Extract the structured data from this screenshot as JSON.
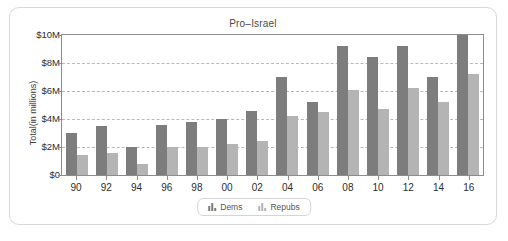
{
  "card": {
    "title": "Pro–Israel"
  },
  "legend": {
    "position": "bottom-center",
    "items": [
      {
        "label": "Dems",
        "color": "#7d7d7d",
        "icon": "bar-chart-icon"
      },
      {
        "label": "Repubs",
        "color": "#b4b4b4",
        "icon": "bar-chart-icon"
      }
    ]
  },
  "chart_data": {
    "type": "bar",
    "title": "Pro–Israel",
    "xlabel": "",
    "ylabel": "Total(in millions)",
    "categories": [
      "90",
      "92",
      "94",
      "96",
      "98",
      "00",
      "02",
      "04",
      "06",
      "08",
      "10",
      "12",
      "14",
      "16"
    ],
    "series": [
      {
        "name": "Dems",
        "color": "#7d7d7d",
        "values": [
          3.0,
          3.5,
          2.0,
          3.6,
          3.8,
          4.0,
          4.6,
          7.0,
          5.2,
          9.2,
          8.4,
          9.2,
          7.0,
          10.0
        ]
      },
      {
        "name": "Repubs",
        "color": "#b4b4b4",
        "values": [
          1.4,
          1.6,
          0.8,
          2.0,
          2.0,
          2.2,
          2.4,
          4.2,
          4.5,
          6.1,
          4.7,
          6.2,
          5.2,
          7.2
        ]
      }
    ],
    "ylim": [
      0,
      10
    ],
    "ytick_values": [
      0,
      2,
      4,
      6,
      8,
      10
    ],
    "ytick_labels": [
      "$0",
      "$2M",
      "$4M",
      "$6M",
      "$8M",
      "$10M"
    ],
    "grid": true,
    "legend_position": "bottom-center",
    "units": "millions of dollars"
  }
}
